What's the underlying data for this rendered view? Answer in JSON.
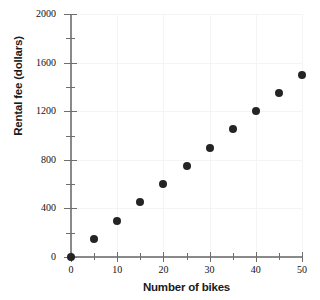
{
  "chart_data": {
    "type": "scatter",
    "title": "",
    "xlabel": "Number of bikes",
    "ylabel": "Rental fee (dollars)",
    "x": [
      0,
      5,
      10,
      15,
      20,
      25,
      30,
      35,
      40,
      45,
      50
    ],
    "values": [
      0,
      150,
      300,
      450,
      600,
      750,
      900,
      1050,
      1200,
      1350,
      1500
    ],
    "series": [
      {
        "name": "Rental fee",
        "values": [
          0,
          150,
          300,
          450,
          600,
          750,
          900,
          1050,
          1200,
          1350,
          1500
        ]
      }
    ],
    "xlim": [
      0,
      50
    ],
    "ylim": [
      0,
      2000
    ],
    "x_major_ticks": [
      0,
      10,
      20,
      30,
      40,
      50
    ],
    "x_minor_ticks": [
      5,
      15,
      25,
      35,
      45
    ],
    "x_tick_labels": [
      "0",
      "10",
      "20",
      "30",
      "40",
      "50"
    ],
    "y_major_ticks": [
      0,
      400,
      800,
      1200,
      1600,
      2000
    ],
    "y_minor_ticks": [
      200,
      600,
      1000,
      1400,
      1800
    ],
    "y_tick_labels": [
      "0",
      "400",
      "800",
      "1200",
      "1600",
      "2000"
    ],
    "grid": true,
    "legend": false,
    "marker_color": "#242424",
    "axis_color": "#8a8a8a",
    "grid_color": "#f4f4f5"
  }
}
